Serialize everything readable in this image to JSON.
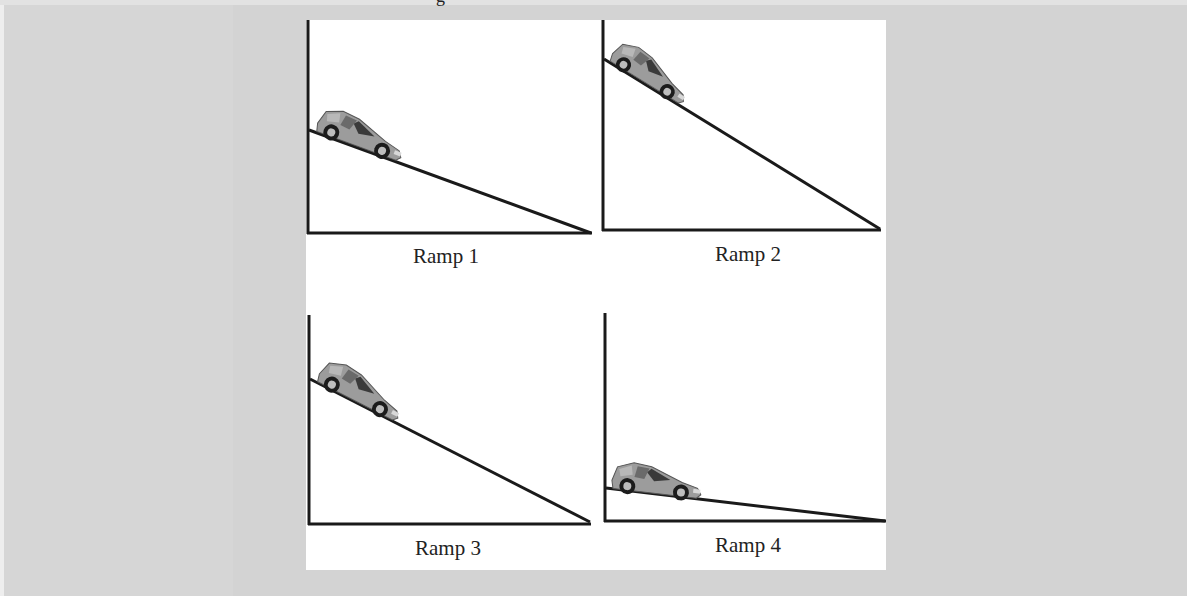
{
  "figure": {
    "title_fragment": "g",
    "background_color": "#d3d3d3",
    "panel_color": "#ffffff",
    "line_color": "#1a1a1a",
    "car_color": "#9a9a9a",
    "ramps": [
      {
        "label": "Ramp 1",
        "icon": "car-icon",
        "ramp_start_height_px": 103,
        "ramp_length_px": 283
      },
      {
        "label": "Ramp 2",
        "icon": "car-icon",
        "ramp_start_height_px": 171,
        "ramp_length_px": 277
      },
      {
        "label": "Ramp 3",
        "icon": "car-icon",
        "ramp_start_height_px": 145,
        "ramp_length_px": 281
      },
      {
        "label": "Ramp 4",
        "icon": "car-icon",
        "ramp_start_height_px": 33,
        "ramp_length_px": 279
      }
    ]
  }
}
